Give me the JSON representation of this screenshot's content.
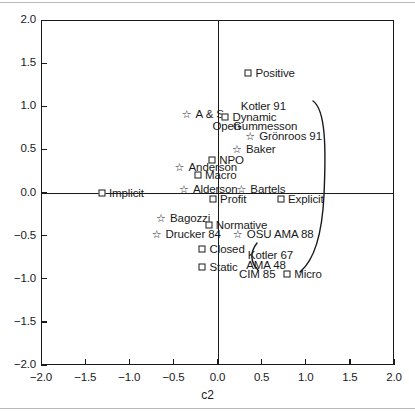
{
  "figure": {
    "width": 415,
    "height": 411,
    "background": "#ffffff",
    "ink": "#1a1a1a"
  },
  "axis": {
    "x_title": "c2",
    "y_title": "",
    "x_ticks": [
      "-2.0",
      "-1.5",
      "-1.0",
      "-0.5",
      "0.0",
      "0.5",
      "1.0",
      "1.5",
      "2.0"
    ],
    "y_ticks": [
      "2.0",
      "1.5",
      "1.0",
      "0.5",
      "0.0",
      "-0.5",
      "-1.0",
      "-1.5",
      "-2.0"
    ]
  },
  "chart_data": {
    "type": "scatter",
    "title": "",
    "subtitle": "",
    "xlabel": "c2",
    "ylabel": "",
    "xlim": [
      -2.0,
      2.0
    ],
    "ylim": [
      -2.0,
      2.0
    ],
    "xticks": [
      -2.0,
      -1.5,
      -1.0,
      -0.5,
      0.0,
      0.5,
      1.0,
      1.5,
      2.0
    ],
    "yticks": [
      -2.0,
      -1.5,
      -1.0,
      -0.5,
      0.0,
      0.5,
      1.0,
      1.5,
      2.0
    ],
    "grid": false,
    "legend": "none",
    "axis_lines_at_zero": true,
    "marker_types": {
      "square": "attribute / category point",
      "star": "author / source point"
    },
    "points": [
      {
        "label": "Positive",
        "x": 0.35,
        "y": 1.38,
        "marker": "square",
        "label_side": "right"
      },
      {
        "label": "A & S",
        "x": -0.35,
        "y": 0.91,
        "marker": "star",
        "label_side": "right"
      },
      {
        "label": "Dynamic",
        "x": 0.09,
        "y": 0.88,
        "marker": "square",
        "label_side": "right"
      },
      {
        "label": "Grönroos 91",
        "x": 0.37,
        "y": 0.66,
        "marker": "star",
        "label_side": "right"
      },
      {
        "label": "Baker",
        "x": 0.22,
        "y": 0.5,
        "marker": "star",
        "label_side": "right"
      },
      {
        "label": "NPO",
        "x": -0.06,
        "y": 0.38,
        "marker": "square",
        "label_side": "right"
      },
      {
        "label": "Anderson",
        "x": -0.43,
        "y": 0.3,
        "marker": "star",
        "label_side": "right"
      },
      {
        "label": "Macro",
        "x": -0.22,
        "y": 0.2,
        "marker": "square",
        "label_side": "right"
      },
      {
        "label": "Alderson",
        "x": -0.38,
        "y": 0.04,
        "marker": "star",
        "label_side": "right"
      },
      {
        "label": "Bartels",
        "x": 0.27,
        "y": 0.04,
        "marker": "star",
        "label_side": "right"
      },
      {
        "label": "Implicit",
        "x": -1.31,
        "y": 0.0,
        "marker": "square",
        "label_side": "right"
      },
      {
        "label": "Profit",
        "x": -0.05,
        "y": -0.08,
        "marker": "square",
        "label_side": "right"
      },
      {
        "label": "Explicit",
        "x": 0.72,
        "y": -0.08,
        "marker": "square",
        "label_side": "right"
      },
      {
        "label": "Bagozzi",
        "x": -0.64,
        "y": -0.29,
        "marker": "star",
        "label_side": "right"
      },
      {
        "label": "Normative",
        "x": -0.1,
        "y": -0.38,
        "marker": "square",
        "label_side": "right"
      },
      {
        "label": "Drucker 84",
        "x": -0.69,
        "y": -0.48,
        "marker": "star",
        "label_side": "right"
      },
      {
        "label": "OSU AMA 88",
        "x": 0.23,
        "y": -0.48,
        "marker": "star",
        "label_side": "right"
      },
      {
        "label": "Closed",
        "x": -0.17,
        "y": -0.66,
        "marker": "square",
        "label_side": "right"
      },
      {
        "label": "Static",
        "x": -0.17,
        "y": -0.86,
        "marker": "square",
        "label_side": "right"
      },
      {
        "label": "Micro",
        "x": 0.79,
        "y": -0.94,
        "marker": "square",
        "label_side": "right"
      }
    ],
    "annotations": [
      {
        "text": "Kotler 91",
        "x": 0.52,
        "y": 1.0
      },
      {
        "text": "Open",
        "x": 0.1,
        "y": 0.77
      },
      {
        "text": "Gummesson",
        "x": 0.54,
        "y": 0.77
      },
      {
        "text": "Kotler 67",
        "x": 0.6,
        "y": -0.72
      },
      {
        "text": "AMA 48",
        "x": 0.55,
        "y": -0.84
      },
      {
        "text": "CIM 85",
        "x": 0.45,
        "y": -0.94
      }
    ],
    "curves": [
      {
        "name": "main-arc",
        "description": "large open arc bulging to the right, from upper right near Kotler 91 down past Explicit toward Kotler 67",
        "path": "M 313 101 C 326 110, 326 150, 324 195 C 322 238, 312 262, 300 272"
      },
      {
        "name": "small-arc",
        "description": "small hook bracket left of Kotler 67 / AMA 48",
        "path": "M 257 243 C 250 252, 250 262, 258 270"
      }
    ]
  }
}
